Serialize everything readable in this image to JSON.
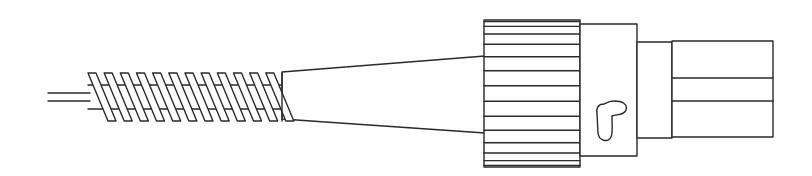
{
  "figure": {
    "caption": "",
    "subject": "fiber-optic connector side view",
    "stroke_color": "#2a2a2a",
    "background_color": "#ffffff",
    "parts": [
      {
        "id": "cable",
        "label": "cable"
      },
      {
        "id": "strain-relief-spring",
        "label": "strain relief spring",
        "coils": 12
      },
      {
        "id": "boot-cone",
        "label": "tapered boot"
      },
      {
        "id": "knurled-nut",
        "label": "knurled coupling nut",
        "ridges": 15
      },
      {
        "id": "connector-body",
        "label": "connector body with key slot"
      },
      {
        "id": "ferrule-sleeve",
        "label": "sleeve"
      },
      {
        "id": "ferrule-tip",
        "label": "ferrule tip"
      }
    ]
  }
}
